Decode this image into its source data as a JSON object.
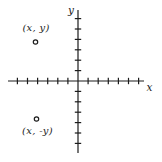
{
  "diagram": {
    "background": "#ffffff",
    "stroke_color": "#1c1c1c",
    "origin": {
      "x": 78,
      "y": 81
    },
    "x_axis": {
      "label": "x",
      "y": 81,
      "from": 8,
      "to": 144,
      "tick_spacing": 10.1,
      "ticks_negative": 6,
      "ticks_positive": 6,
      "label_cx": 149.5,
      "label_cy": 86.5
    },
    "y_axis": {
      "label": "y",
      "x": 78,
      "from": 10,
      "to": 153,
      "tick_spacing": 10.4,
      "ticks_negative": 6,
      "ticks_positive": 6,
      "label_cx": 71,
      "label_cy": 10
    },
    "tick_half_length": 3.2,
    "line_width": 1.2,
    "point_radius": 2.2,
    "points": [
      {
        "label": "(x, y)",
        "cx": 35.5,
        "cy": 42,
        "label_cx": 36,
        "label_cy": 27.5
      },
      {
        "label": "(x, -y)",
        "cx": 36.5,
        "cy": 119,
        "label_cx": 37.5,
        "label_cy": 130.5
      }
    ]
  }
}
